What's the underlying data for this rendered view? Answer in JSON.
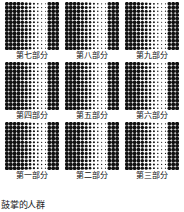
{
  "figure": {
    "caption": "鼓掌的人群",
    "dot_color": "#111111",
    "background_color": "#ffffff",
    "grid_rows": 3,
    "grid_cols": 3
  },
  "panels": [
    {
      "label": "第七部分",
      "name": "panel-part-seven"
    },
    {
      "label": "第八部分",
      "name": "panel-part-eight"
    },
    {
      "label": "第九部分",
      "name": "panel-part-nine"
    },
    {
      "label": "第四部分",
      "name": "panel-part-four"
    },
    {
      "label": "第五部分",
      "name": "panel-part-five"
    },
    {
      "label": "第六部分",
      "name": "panel-part-six"
    },
    {
      "label": "第一部分",
      "name": "panel-part-one"
    },
    {
      "label": "第二部分",
      "name": "panel-part-two"
    },
    {
      "label": "第三部分",
      "name": "panel-part-three"
    }
  ],
  "chart_data": {
    "type": "heatmap",
    "title": "鼓掌的人群",
    "xlabel": "",
    "ylabel": "",
    "panel_rows": 13,
    "panel_cols": 14,
    "value_range": [
      0,
      1
    ],
    "column_profile": [
      1.0,
      1.0,
      1.0,
      0.95,
      0.88,
      0.8,
      0.66,
      0.52,
      0.4,
      0.3,
      0.26,
      0.95,
      1.0,
      1.0
    ],
    "panels": [
      {
        "label": "第七部分",
        "column_profile": [
          1.0,
          1.0,
          1.0,
          0.95,
          0.88,
          0.8,
          0.66,
          0.52,
          0.4,
          0.3,
          0.26,
          0.95,
          1.0,
          1.0
        ]
      },
      {
        "label": "第八部分",
        "column_profile": [
          1.0,
          1.0,
          0.98,
          0.92,
          0.85,
          0.76,
          0.62,
          0.5,
          0.38,
          0.3,
          0.3,
          0.92,
          1.0,
          1.0
        ]
      },
      {
        "label": "第九部分",
        "column_profile": [
          1.0,
          1.0,
          0.97,
          0.9,
          0.83,
          0.74,
          0.6,
          0.48,
          0.36,
          0.28,
          0.3,
          0.94,
          1.0,
          1.0
        ]
      },
      {
        "label": "第四部分",
        "column_profile": [
          1.0,
          1.0,
          1.0,
          0.96,
          0.9,
          0.82,
          0.68,
          0.54,
          0.42,
          0.32,
          0.3,
          0.96,
          1.0,
          1.0
        ]
      },
      {
        "label": "第五部分",
        "column_profile": [
          1.0,
          1.0,
          0.99,
          0.93,
          0.86,
          0.78,
          0.64,
          0.5,
          0.38,
          0.3,
          0.28,
          0.93,
          1.0,
          1.0
        ]
      },
      {
        "label": "第六部分",
        "column_profile": [
          1.0,
          1.0,
          0.98,
          0.92,
          0.84,
          0.75,
          0.62,
          0.48,
          0.36,
          0.28,
          0.3,
          0.95,
          1.0,
          1.0
        ]
      },
      {
        "label": "第一部分",
        "column_profile": [
          1.0,
          1.0,
          1.0,
          0.97,
          0.91,
          0.84,
          0.7,
          0.56,
          0.44,
          0.34,
          0.3,
          0.96,
          1.0,
          1.0
        ]
      },
      {
        "label": "第二部分",
        "column_profile": [
          1.0,
          1.0,
          0.99,
          0.94,
          0.87,
          0.79,
          0.65,
          0.52,
          0.4,
          0.3,
          0.28,
          0.94,
          1.0,
          1.0
        ]
      },
      {
        "label": "第三部分",
        "column_profile": [
          1.0,
          1.0,
          0.98,
          0.93,
          0.85,
          0.76,
          0.63,
          0.5,
          0.38,
          0.29,
          0.3,
          0.95,
          1.0,
          1.0
        ]
      }
    ]
  }
}
